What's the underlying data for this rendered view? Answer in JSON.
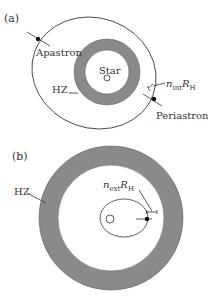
{
  "panel_a": {
    "label": "(a)",
    "star_label": "Star",
    "hz_label": "HZ",
    "apastron_label": "Apastron",
    "periastron_label": "Periastron",
    "radius_label_main": "n",
    "radius_label_sub": "int",
    "radius_label_R": "R",
    "radius_label_H": "H"
  },
  "panel_b": {
    "label": "(b)",
    "hz_label": "HZ",
    "radius_label_main": "n",
    "radius_label_sub": "ext",
    "radius_label_R": "R",
    "radius_label_H": "H"
  },
  "colors": {
    "hz_fill": "#8a8a8a",
    "line": "#333333",
    "background": "#ffffff"
  }
}
